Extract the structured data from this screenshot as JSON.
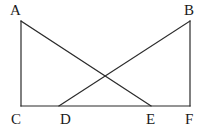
{
  "figure": {
    "background_color": "#ffffff",
    "stroke_color": "#2b2b2b",
    "stroke_width": 1.2,
    "width": 208,
    "height": 134
  },
  "points": {
    "A": {
      "label": "A",
      "x": 21,
      "y": 21
    },
    "B": {
      "label": "B",
      "x": 190,
      "y": 21
    },
    "C": {
      "label": "C",
      "x": 21,
      "y": 106
    },
    "D": {
      "label": "D",
      "x": 59,
      "y": 106
    },
    "E": {
      "label": "E",
      "x": 151,
      "y": 106
    },
    "F": {
      "label": "F",
      "x": 190,
      "y": 106
    },
    "X": {
      "label": "",
      "x": 104,
      "y": 74
    }
  },
  "segments": [
    {
      "name": "AC",
      "from": "A",
      "to": "C",
      "x1": 21,
      "y1": 21,
      "x2": 21,
      "y2": 106
    },
    {
      "name": "BF",
      "from": "B",
      "to": "F",
      "x1": 190,
      "y1": 21,
      "x2": 190,
      "y2": 106
    },
    {
      "name": "CF",
      "from": "C",
      "to": "F",
      "x1": 21,
      "y1": 106,
      "x2": 190,
      "y2": 106
    },
    {
      "name": "AE",
      "from": "A",
      "to": "E",
      "x1": 21,
      "y1": 21,
      "x2": 151,
      "y2": 106
    },
    {
      "name": "BD",
      "from": "B",
      "to": "D",
      "x1": 190,
      "y1": 21,
      "x2": 59,
      "y2": 106
    }
  ],
  "labels": {
    "A": "A",
    "B": "B",
    "C": "C",
    "D": "D",
    "E": "E",
    "F": "F"
  }
}
